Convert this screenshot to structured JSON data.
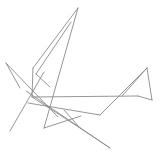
{
  "canvas": {
    "width": 163,
    "height": 166,
    "background_color": "#ffffff",
    "stroke_color": "#8a8a8a",
    "stroke_width": 0.9
  },
  "chart_data": {
    "type": "scatter",
    "title": "",
    "subtitle": "",
    "xlabel": "",
    "ylabel": "",
    "xlim": [
      0,
      163
    ],
    "ylim": [
      0,
      166
    ],
    "grid": false,
    "legend": "none",
    "annotations": [],
    "tick_labels": {
      "x": [],
      "y": []
    },
    "series": [
      {
        "name": "segments",
        "type": "line-segments",
        "values": [
          {
            "id": "s1",
            "x1": 78,
            "y1": 8,
            "x2": 33,
            "y2": 68
          },
          {
            "id": "s2",
            "x1": 78,
            "y1": 8,
            "x2": 44,
            "y2": 128
          },
          {
            "id": "s3",
            "x1": 71,
            "y1": 22,
            "x2": 36,
            "y2": 74
          },
          {
            "id": "s4",
            "x1": 6,
            "y1": 63,
            "x2": 58,
            "y2": 117
          },
          {
            "id": "s5",
            "x1": 33,
            "y1": 68,
            "x2": 32,
            "y2": 97
          },
          {
            "id": "s6",
            "x1": 10,
            "y1": 131,
            "x2": 44,
            "y2": 72
          },
          {
            "id": "s7",
            "x1": 32,
            "y1": 97,
            "x2": 138,
            "y2": 96
          },
          {
            "id": "s8",
            "x1": 32,
            "y1": 97,
            "x2": 80,
            "y2": 128
          },
          {
            "id": "s9",
            "x1": 44,
            "y1": 128,
            "x2": 81,
            "y2": 116
          },
          {
            "id": "s10",
            "x1": 26,
            "y1": 91,
            "x2": 110,
            "y2": 148
          },
          {
            "id": "s11",
            "x1": 80,
            "y1": 128,
            "x2": 110,
            "y2": 148
          },
          {
            "id": "s12",
            "x1": 80,
            "y1": 128,
            "x2": 64,
            "y2": 110
          },
          {
            "id": "s13",
            "x1": 28,
            "y1": 103,
            "x2": 100,
            "y2": 115
          },
          {
            "id": "s14",
            "x1": 100,
            "y1": 115,
            "x2": 147,
            "y2": 68
          },
          {
            "id": "s15",
            "x1": 147,
            "y1": 68,
            "x2": 152,
            "y2": 100
          },
          {
            "id": "s16",
            "x1": 122,
            "y1": 96,
            "x2": 147,
            "y2": 68
          },
          {
            "id": "s17",
            "x1": 138,
            "y1": 96,
            "x2": 152,
            "y2": 100
          },
          {
            "id": "s18",
            "x1": 6,
            "y1": 63,
            "x2": 20,
            "y2": 88
          },
          {
            "id": "s19",
            "x1": 36,
            "y1": 74,
            "x2": 50,
            "y2": 87
          }
        ]
      }
    ]
  }
}
